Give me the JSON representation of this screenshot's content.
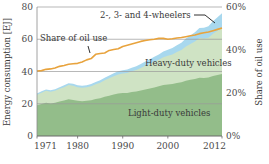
{
  "chart_data": {
    "type": "area",
    "title": "",
    "subtitle": "",
    "xlabel": "",
    "ylabel": "Energy consumption [EJ]",
    "y2label": "Share of oil use",
    "xlim": [
      1971,
      2012
    ],
    "ylim": [
      0,
      80
    ],
    "y2lim": [
      0,
      60
    ],
    "grid": true,
    "legend_position": "inline-annotations",
    "xticks": [
      "1971",
      "1980",
      "1990",
      "2000",
      "2012"
    ],
    "xtick_values": [
      1971,
      1980,
      1990,
      2000,
      2012
    ],
    "yticks": [
      "0",
      "20",
      "40",
      "60",
      "80"
    ],
    "ytick_values": [
      0,
      20,
      40,
      60,
      80
    ],
    "y2ticks": [
      "0%",
      "20%",
      "40%",
      "60%"
    ],
    "y2tick_values": [
      0,
      20,
      40,
      60
    ],
    "x": [
      1971,
      1972,
      1973,
      1974,
      1975,
      1976,
      1977,
      1978,
      1979,
      1980,
      1981,
      1982,
      1983,
      1984,
      1985,
      1986,
      1987,
      1988,
      1989,
      1990,
      1991,
      1992,
      1993,
      1994,
      1995,
      1996,
      1997,
      1998,
      1999,
      2000,
      2001,
      2002,
      2003,
      2004,
      2005,
      2006,
      2007,
      2008,
      2009,
      2010,
      2011,
      2012
    ],
    "series": [
      {
        "name": "Light-duty vehicles",
        "color": "#93bd8a",
        "stack": "bottom",
        "values": [
          19.0,
          19.8,
          20.6,
          20.2,
          20.6,
          21.4,
          22.0,
          22.8,
          22.4,
          21.8,
          21.6,
          21.8,
          22.2,
          22.9,
          23.4,
          24.3,
          25.0,
          25.7,
          26.3,
          26.6,
          26.7,
          27.3,
          27.6,
          28.2,
          28.9,
          29.5,
          30.1,
          30.8,
          31.6,
          31.9,
          32.2,
          32.9,
          33.4,
          34.3,
          34.9,
          35.4,
          36.2,
          35.9,
          36.3,
          37.2,
          37.8,
          38.4
        ]
      },
      {
        "name": "Heavy-duty vehicles",
        "color": "#cfe3c4",
        "stack": "middle",
        "values": [
          6.6,
          7.0,
          7.4,
          7.2,
          7.4,
          7.9,
          8.3,
          8.8,
          8.8,
          8.4,
          8.3,
          8.4,
          8.7,
          9.2,
          9.6,
          10.2,
          10.8,
          11.4,
          11.9,
          12.2,
          12.4,
          12.9,
          13.3,
          13.9,
          14.6,
          15.2,
          15.9,
          16.5,
          17.3,
          17.9,
          18.4,
          19.2,
          20.0,
          21.2,
          22.2,
          23.2,
          24.5,
          24.6,
          24.7,
          26.2,
          27.4,
          28.5
        ]
      },
      {
        "name": "2-, 3- and 4-wheelers",
        "color": "#a8d8ee",
        "stack": "top",
        "values": [
          0.8,
          0.9,
          0.9,
          0.9,
          1.0,
          1.0,
          1.1,
          1.1,
          1.2,
          1.2,
          1.2,
          1.3,
          1.3,
          1.4,
          1.5,
          1.6,
          1.7,
          1.8,
          1.9,
          2.0,
          2.1,
          2.2,
          2.4,
          2.5,
          2.7,
          2.9,
          3.1,
          3.3,
          3.5,
          3.7,
          3.9,
          4.2,
          4.5,
          4.9,
          5.3,
          5.7,
          6.2,
          6.6,
          7.0,
          7.7,
          8.4,
          9.2
        ]
      }
    ],
    "line_series": {
      "name": "Share of oil use",
      "color": "#e8a33d",
      "axis": "right",
      "unit": "%",
      "values": [
        30.2,
        30.4,
        31.0,
        31.2,
        31.6,
        32.4,
        32.8,
        33.4,
        33.6,
        33.8,
        34.4,
        35.4,
        36.0,
        38.0,
        38.4,
        38.6,
        39.8,
        40.2,
        40.6,
        41.6,
        42.2,
        42.8,
        43.4,
        44.0,
        44.4,
        44.8,
        45.0,
        45.4,
        45.4,
        45.0,
        45.2,
        45.6,
        45.8,
        46.2,
        46.6,
        47.0,
        47.6,
        48.0,
        48.4,
        49.0,
        49.6,
        50.2
      ]
    },
    "annotations": [
      {
        "name": "2-, 3- and 4-wheelers",
        "text": "2-, 3- and 4-wheelers",
        "has_leader": true
      },
      {
        "name": "Share of oil use",
        "text": "Share of oil use",
        "has_leader": true
      },
      {
        "name": "Heavy-duty vehicles",
        "text": "Heavy-duty vehicles",
        "has_leader": false
      },
      {
        "name": "Light-duty vehicles",
        "text": "Light-duty vehicles",
        "has_leader": false
      }
    ],
    "colors": {
      "light_duty": "#93bd8a",
      "heavy_duty": "#cfe3c4",
      "wheelers": "#a8d8ee",
      "oil_share_line": "#e8a33d",
      "grid": "#9a9a9a",
      "text": "#3a3a3a",
      "background": "#ffffff"
    }
  }
}
